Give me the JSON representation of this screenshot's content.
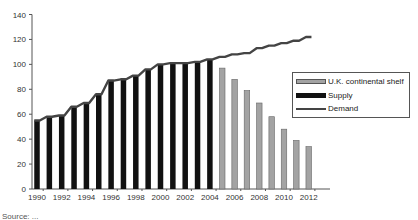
{
  "chart_data": {
    "type": "bar",
    "title": "",
    "xlabel": "",
    "ylabel": "",
    "ylim": [
      0,
      140
    ],
    "yticks": [
      0,
      20,
      40,
      60,
      80,
      100,
      120,
      140
    ],
    "grid": false,
    "legend_position": "right-inside",
    "categories": [
      "1990",
      "1991",
      "1992",
      "1993",
      "1994",
      "1995",
      "1996",
      "1997",
      "1998",
      "1999",
      "2000",
      "2001",
      "2002",
      "2003",
      "2004",
      "2005",
      "2006",
      "2007",
      "2008",
      "2009",
      "2010",
      "2011",
      "2012"
    ],
    "xtick_labels": [
      "1990",
      "1992",
      "1994",
      "1996",
      "1998",
      "2000",
      "2002",
      "2004",
      "2006",
      "2008",
      "2010",
      "2012"
    ],
    "series": [
      {
        "name": "U.K. continental shelf",
        "type": "bar",
        "color": "#a3a3a3",
        "values": [
          null,
          null,
          null,
          null,
          null,
          null,
          null,
          null,
          null,
          null,
          null,
          null,
          null,
          null,
          null,
          97,
          88,
          79,
          69,
          58,
          48,
          39,
          34
        ]
      },
      {
        "name": "Supply",
        "type": "bar",
        "color": "#111111",
        "values": [
          55,
          58,
          59,
          66,
          69,
          76,
          87,
          88,
          91,
          96,
          100,
          101,
          101,
          102,
          104,
          null,
          null,
          null,
          null,
          null,
          null,
          null,
          null
        ]
      },
      {
        "name": "Demand",
        "type": "line",
        "color": "#444444",
        "values": [
          55,
          58,
          59,
          66,
          69,
          76,
          87,
          88,
          91,
          96,
          100,
          101,
          101,
          102,
          104,
          106,
          108,
          109,
          113,
          115,
          117,
          119,
          122
        ]
      }
    ]
  },
  "legend": {
    "items": [
      {
        "label": "U.K. continental shelf"
      },
      {
        "label": "Supply"
      },
      {
        "label": "Demand"
      }
    ]
  },
  "source": "Source: ..."
}
